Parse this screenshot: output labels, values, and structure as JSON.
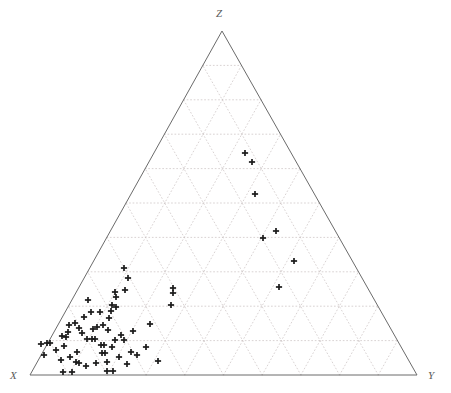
{
  "figure": {
    "type": "ternary-scatter",
    "background_color": "#ffffff",
    "axis_color": "#6b6b6b",
    "grid_color": "#c9c0c0",
    "marker_color": "#1a1a1a"
  },
  "labels": {
    "top_vertex": "Z",
    "left_vertex": "X",
    "right_vertex": "Y"
  },
  "chart_data": {
    "type": "scatter",
    "title": "",
    "xlabel": "X",
    "ylabel": "Y",
    "zlabel": "Z",
    "axes": [
      "X",
      "Y",
      "Z"
    ],
    "grid": true,
    "grid_interval": 10,
    "axis_range": [
      0,
      100
    ],
    "legend": null,
    "marker": "plus",
    "n_points": 71,
    "geometry": {
      "apex_top": [
        222,
        31
      ],
      "vertex_left": [
        30,
        375
      ],
      "vertex_right": [
        417,
        375
      ]
    },
    "points_pixel": [
      [
        245,
        153
      ],
      [
        252,
        162
      ],
      [
        255,
        194
      ],
      [
        276,
        231
      ],
      [
        263,
        238
      ],
      [
        294,
        261
      ],
      [
        279,
        287
      ],
      [
        124,
        268
      ],
      [
        128,
        278
      ],
      [
        125,
        290
      ],
      [
        173,
        288
      ],
      [
        173,
        293
      ],
      [
        115,
        292
      ],
      [
        116,
        297
      ],
      [
        171,
        305
      ],
      [
        112,
        305
      ],
      [
        116,
        307
      ],
      [
        111,
        311
      ],
      [
        69,
        325
      ],
      [
        75,
        323
      ],
      [
        79,
        328
      ],
      [
        68,
        332
      ],
      [
        97,
        327
      ],
      [
        103,
        325
      ],
      [
        108,
        330
      ],
      [
        150,
        324
      ],
      [
        62,
        336
      ],
      [
        66,
        337
      ],
      [
        87,
        339
      ],
      [
        92,
        339
      ],
      [
        95,
        339
      ],
      [
        115,
        340
      ],
      [
        124,
        340
      ],
      [
        47,
        343
      ],
      [
        50,
        343
      ],
      [
        41,
        344
      ],
      [
        101,
        345
      ],
      [
        104,
        345
      ],
      [
        112,
        347
      ],
      [
        44,
        355
      ],
      [
        77,
        352
      ],
      [
        102,
        353
      ],
      [
        105,
        353
      ],
      [
        137,
        355
      ],
      [
        61,
        360
      ],
      [
        76,
        362
      ],
      [
        79,
        363
      ],
      [
        96,
        363
      ],
      [
        107,
        362
      ],
      [
        63,
        372
      ],
      [
        72,
        372
      ],
      [
        107,
        371
      ],
      [
        113,
        371
      ],
      [
        56,
        350
      ],
      [
        84,
        317
      ],
      [
        91,
        312
      ],
      [
        133,
        331
      ],
      [
        121,
        335
      ],
      [
        109,
        318
      ],
      [
        100,
        312
      ],
      [
        88,
        300
      ],
      [
        82,
        333
      ],
      [
        131,
        352
      ],
      [
        64,
        346
      ],
      [
        119,
        357
      ],
      [
        93,
        329
      ],
      [
        70,
        357
      ],
      [
        86,
        366
      ],
      [
        146,
        347
      ],
      [
        127,
        364
      ],
      [
        158,
        361
      ]
    ]
  }
}
